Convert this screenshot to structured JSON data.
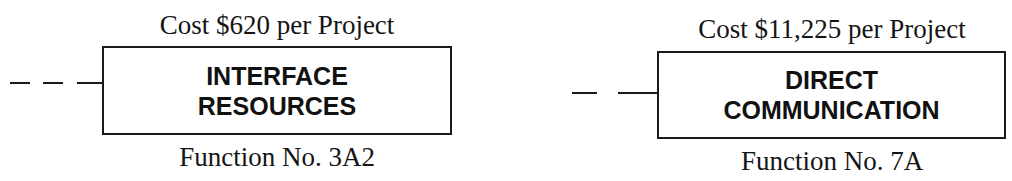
{
  "nodes": [
    {
      "cost": "Cost $620 per Project",
      "title_line1": "INTERFACE",
      "title_line2": "RESOURCES",
      "function_no": "Function No. 3A2"
    },
    {
      "cost": "Cost $11,225 per Project",
      "title_line1": "DIRECT",
      "title_line2": "COMMUNICATION",
      "function_no": "Function No. 7A"
    }
  ],
  "colors": {
    "line": "#1a1a1a",
    "text": "#141414",
    "background": "#ffffff"
  }
}
